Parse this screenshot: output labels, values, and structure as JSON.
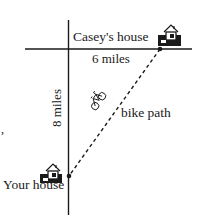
{
  "diagram": {
    "title": "",
    "labels": {
      "casey_house": "Casey's house",
      "your_house": "Your house",
      "horizontal_distance": "6 miles",
      "vertical_distance": "8 miles",
      "bike_path": "bike path",
      "stray_mark": ","
    },
    "nodes": [
      {
        "id": "casey-house",
        "label": "Casey's house",
        "x": 160,
        "y": 49,
        "icon": "house-icon"
      },
      {
        "id": "your-house",
        "label": "Your house",
        "x": 69,
        "y": 176,
        "icon": "house-icon"
      }
    ],
    "edges": [
      {
        "from": "intersection",
        "to": "casey-house",
        "label": "6 miles",
        "style": "solid",
        "direction": "horizontal"
      },
      {
        "from": "intersection",
        "to": "your-house",
        "label": "8 miles",
        "style": "solid",
        "direction": "vertical"
      },
      {
        "from": "your-house",
        "to": "casey-house",
        "label": "bike path",
        "style": "dashed",
        "icon": "bicycle-icon"
      }
    ],
    "colors": {
      "ink": "#1a1a1a",
      "background": "#ffffff"
    }
  }
}
